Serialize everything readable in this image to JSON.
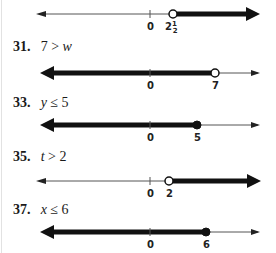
{
  "page": {
    "border_color": "#e2e2e2",
    "ink_color": "#1a1a1a"
  },
  "problems": [
    {
      "number": null,
      "label": null,
      "number_line": {
        "ticks": [
          "0"
        ],
        "point_label": "2½",
        "point_value": 2.5,
        "endpoint": "open",
        "direction": "right"
      }
    },
    {
      "number": "31.",
      "lhs": "7",
      "op": ">",
      "rhs": "w",
      "number_line": {
        "ticks": [
          "0"
        ],
        "point_label": "7",
        "point_value": 7,
        "endpoint": "open",
        "direction": "left"
      }
    },
    {
      "number": "33.",
      "lhs": "y",
      "op": "≤",
      "rhs": "5",
      "number_line": {
        "ticks": [
          "0"
        ],
        "point_label": "5",
        "point_value": 5,
        "endpoint": "closed",
        "direction": "left"
      }
    },
    {
      "number": "35.",
      "lhs": "t",
      "op": ">",
      "rhs": "2",
      "number_line": {
        "ticks": [
          "0"
        ],
        "point_label": "2",
        "point_value": 2,
        "endpoint": "open",
        "direction": "right"
      }
    },
    {
      "number": "37.",
      "lhs": "x",
      "op": "≤",
      "rhs": "6",
      "number_line": {
        "ticks": [
          "0"
        ],
        "point_label": "6",
        "point_value": 6,
        "endpoint": "closed",
        "direction": "left"
      }
    }
  ]
}
